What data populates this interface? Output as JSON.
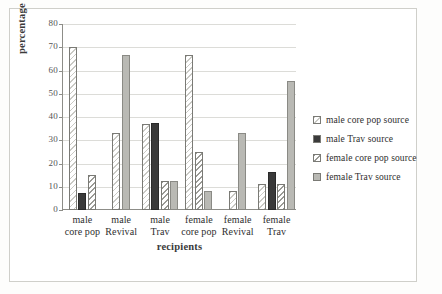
{
  "chart_data": {
    "type": "bar",
    "title": "",
    "xlabel": "recipients",
    "ylabel": "percentage of pairs",
    "ylim": [
      0,
      80
    ],
    "yticks": [
      0,
      10,
      20,
      30,
      40,
      50,
      60,
      70,
      80
    ],
    "ytick_labels": [
      "0",
      "10",
      "20",
      "30",
      "40",
      "50",
      "60",
      "70",
      "80"
    ],
    "grid": true,
    "legend_position": "right",
    "categories": [
      "male core pop",
      "male Revival",
      "male Trav",
      "female core pop",
      "female Revival",
      "female Trav"
    ],
    "category_lines": [
      [
        "male",
        "core pop"
      ],
      [
        "male",
        "Revival"
      ],
      [
        "male",
        "Trav"
      ],
      [
        "female",
        "core pop"
      ],
      [
        "female",
        "Revival"
      ],
      [
        "female",
        "Trav"
      ]
    ],
    "series": [
      {
        "name": "male core pop source",
        "fill": "light-hatch",
        "color": "#ffffff",
        "values": [
          70.0,
          33.0,
          37.0,
          66.5,
          8.0,
          11.0
        ]
      },
      {
        "name": "male Trav source",
        "fill": "solid-dark",
        "color": "#3a3a3a",
        "values": [
          7.5,
          0,
          37.5,
          0,
          0,
          16.5
        ]
      },
      {
        "name": "female core pop source",
        "fill": "diagonal-hatch",
        "color": "#9a9a95",
        "values": [
          15.0,
          0,
          12.5,
          25.0,
          0,
          11.0
        ]
      },
      {
        "name": "female Trav source",
        "fill": "light-gray",
        "color": "#b9b9b4",
        "values": [
          0,
          66.5,
          12.5,
          8.0,
          33.0,
          55.5
        ]
      }
    ]
  },
  "legend": {
    "items": [
      {
        "label": "male core pop source",
        "swatch": "light-hatch"
      },
      {
        "label": "male Trav source",
        "swatch": "solid-dark"
      },
      {
        "label": "female core pop source",
        "swatch": "diagonal-hatch"
      },
      {
        "label": "female Trav source",
        "swatch": "light-gray"
      }
    ]
  }
}
